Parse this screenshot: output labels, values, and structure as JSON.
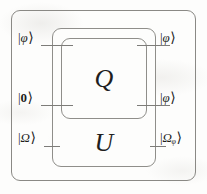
{
  "figure": {
    "kind": "quantum-circuit-diagram",
    "ink_color": "#2a2a2a",
    "line_color": "#8e8d8a",
    "background": "#fdfdfc"
  },
  "boxes": {
    "outer": {
      "label": ""
    },
    "middle": {
      "label": "U"
    },
    "inner": {
      "label": "Q"
    }
  },
  "kets": {
    "bar": "|",
    "angle": "⟩"
  },
  "inputs": [
    {
      "name": "input-phi",
      "symbol": "φ",
      "subscript": "",
      "bold": false
    },
    {
      "name": "input-zero",
      "symbol": "0",
      "subscript": "",
      "bold": true
    },
    {
      "name": "input-omega",
      "symbol": "Ω",
      "subscript": "",
      "bold": false
    }
  ],
  "outputs": [
    {
      "name": "output-phi",
      "symbol": "φ",
      "subscript": "",
      "bold": false
    },
    {
      "name": "output-phi-2",
      "symbol": "φ",
      "subscript": "",
      "bold": false
    },
    {
      "name": "output-omega-phi",
      "symbol": "Ω",
      "subscript": "φ",
      "bold": false
    }
  ]
}
